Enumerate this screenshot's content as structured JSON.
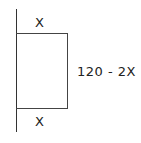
{
  "diagram": {
    "labels": {
      "top": "X",
      "bottom": "X",
      "right": "120 - 2X"
    },
    "colors": {
      "line": "#333333",
      "text": "#222222",
      "background": "#ffffff"
    }
  }
}
